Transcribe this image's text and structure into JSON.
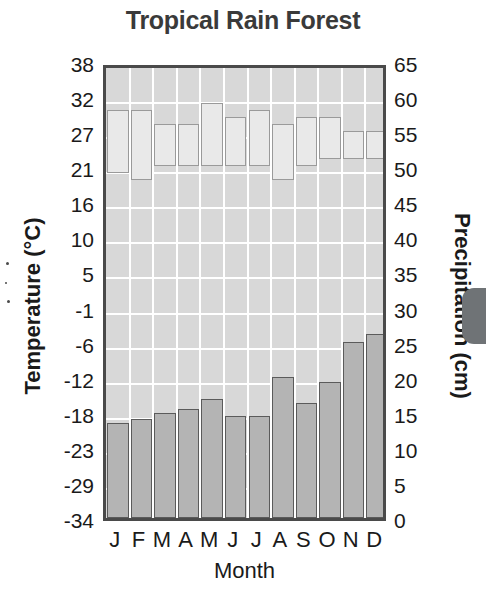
{
  "title": "Tropical Rain Forest",
  "axes": {
    "left_title": "Temperature (°C)",
    "right_title": "Precipitation (cm)",
    "x_title": "Month",
    "left_ticks": [
      "38",
      "32",
      "27",
      "21",
      "16",
      "10",
      "5",
      "-1",
      "-6",
      "-12",
      "-18",
      "-23",
      "-29",
      "-34"
    ],
    "right_ticks": [
      "65",
      "60",
      "55",
      "50",
      "45",
      "40",
      "35",
      "30",
      "25",
      "20",
      "15",
      "10",
      "5",
      "0"
    ],
    "month_labels": [
      "J",
      "F",
      "M",
      "A",
      "M",
      "J",
      "J",
      "A",
      "S",
      "O",
      "N",
      "D"
    ]
  },
  "colors": {
    "plot_background": "#d8d8d8",
    "gridline": "#ffffff",
    "plot_border": "#4a4a4a",
    "temp_bar_fill": "#b4b4b4",
    "temp_bar_stroke": "#5b5b5b",
    "precip_bar_fill": "#e9e9e9",
    "precip_bar_stroke": "#9a9a9a",
    "title_text": "#3a3a3a",
    "label_text": "#1a1a1a",
    "page_tab": "#6f7376"
  },
  "chart_data": {
    "type": "bar",
    "title": "Tropical Rain Forest",
    "subtitle": "",
    "xlabel": "Month",
    "ylabel": "Temperature (°C)",
    "y2label": "Precipitation (cm)",
    "grid": true,
    "legend_position": "none",
    "categories": [
      "J",
      "F",
      "M",
      "A",
      "M",
      "J",
      "J",
      "A",
      "S",
      "O",
      "N",
      "D"
    ],
    "ylim": [
      -34,
      38
    ],
    "y2lim": [
      0,
      65
    ],
    "ytick_values": [
      38,
      32,
      27,
      21,
      16,
      10,
      5,
      -1,
      -6,
      -12,
      -18,
      -23,
      -29,
      -34
    ],
    "y2tick_values": [
      65,
      60,
      55,
      50,
      45,
      40,
      35,
      30,
      25,
      20,
      15,
      10,
      5,
      0
    ],
    "series": [
      {
        "name": "Precipitation",
        "unit": "cm",
        "axis": "right",
        "render": "outlined-box-band",
        "values": [
          59,
          59,
          57,
          57,
          60,
          58,
          59,
          57,
          58,
          58,
          56,
          56
        ],
        "box_bottoms": [
          50,
          49,
          51,
          51,
          51,
          51,
          51,
          49,
          51,
          52,
          52,
          52
        ]
      },
      {
        "name": "Temperature",
        "unit": "°C",
        "axis": "left",
        "render": "solid-bar",
        "values": [
          -19.0,
          -18.3,
          -17.4,
          -16.8,
          -15.2,
          -17.9,
          -17.9,
          -11.8,
          -15.8,
          -12.6,
          -6.2,
          -5.0
        ],
        "values_mm_scale": [
          14.3,
          15.0,
          15.9,
          16.5,
          18.1,
          15.2,
          15.2,
          21.3,
          17.4,
          20.3,
          27.0,
          28.2
        ]
      }
    ]
  }
}
